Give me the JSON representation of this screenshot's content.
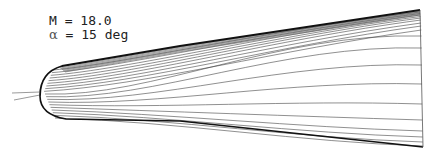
{
  "figure": {
    "type": "streamline-plot",
    "annotations": {
      "mach_label": "M = 18.0",
      "alpha_symbol": "α",
      "alpha_label": " = 15 deg"
    },
    "parameters": {
      "mach_number": 18.0,
      "angle_of_attack_deg": 15
    },
    "colors": {
      "background": "#ffffff",
      "lines": "#333333",
      "boundary": "#111111"
    },
    "right_edge_streamline_y": [
      12,
      13.5,
      15,
      16.5,
      18,
      20,
      23,
      26,
      30,
      36,
      48,
      65,
      84,
      104,
      120,
      131,
      137,
      142,
      146
    ]
  }
}
